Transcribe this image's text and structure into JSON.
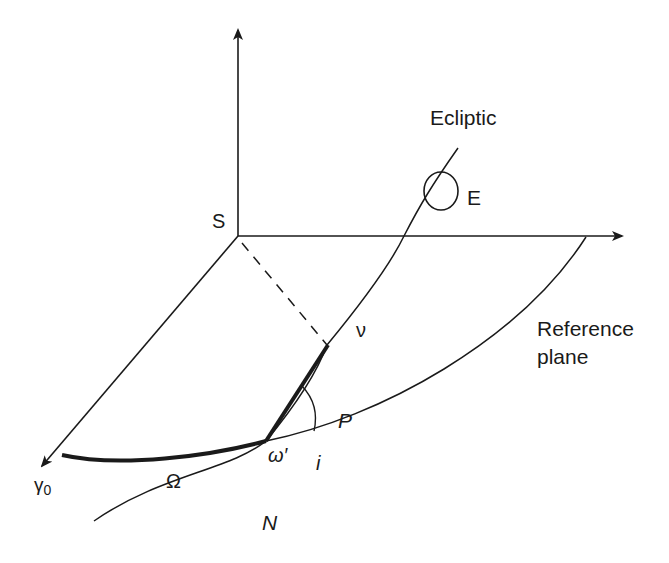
{
  "figure": {
    "type": "orbital-elements-diagram",
    "colors": {
      "line": "#1a1a1a",
      "background": "#ffffff"
    },
    "labels": {
      "origin": "S",
      "ecliptic": "Ecliptic",
      "earth": "E",
      "reference_plane_line1": "Reference",
      "reference_plane_line2": "plane",
      "vernal_equinox": "γ",
      "vernal_equinox_sub": "0",
      "true_anomaly": "ν",
      "perihelion": "P",
      "argument_of_perihelion": "ω′",
      "inclination": "i",
      "longitude_of_node": "Ω",
      "ascending_node": "N"
    },
    "elements": {
      "axes": [
        "vertical-axis",
        "horizontal-axis",
        "gamma0-axis"
      ],
      "curves": [
        "reference-plane-arc",
        "ecliptic-curve"
      ],
      "highlighted": [
        "omega-arc (Ω, thick)",
        "omega-prime-segment (ω′, thick)"
      ],
      "construction": [
        "dashed line S→P",
        "inclination angle arc i at N"
      ],
      "markers": [
        "earth circle E on ecliptic"
      ]
    }
  }
}
